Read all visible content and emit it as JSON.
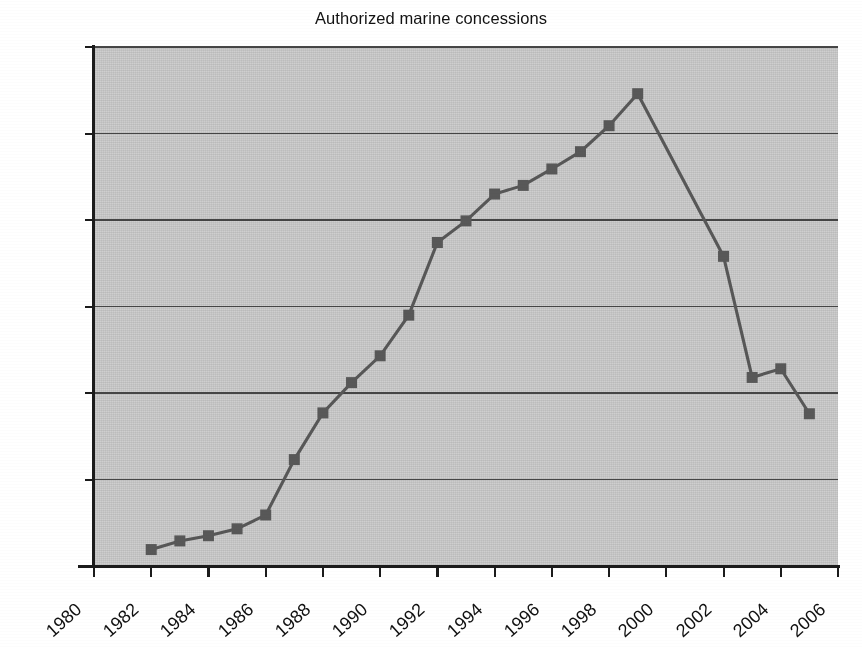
{
  "chart_data": {
    "type": "line",
    "title": "Authorized marine concessions",
    "xlabel": "",
    "ylabel": "",
    "xlim": [
      1980,
      2006
    ],
    "ylim": [
      0,
      3000
    ],
    "ytick_step": 500,
    "xtick_step": 2,
    "grid": true,
    "legend": "none",
    "marker": "square",
    "series_color": "#585858",
    "plot_background": "#c9c9c9",
    "ytick_labels": [
      "3,000",
      "2,500",
      "2,000",
      "1,500",
      "1,000",
      "500",
      "0"
    ],
    "ytick_values": [
      3000,
      2500,
      2000,
      1500,
      1000,
      500,
      0
    ],
    "xtick_labels": [
      "1980",
      "1982",
      "1984",
      "1986",
      "1988",
      "1990",
      "1992",
      "1994",
      "1996",
      "1998",
      "2000",
      "2002",
      "2004",
      "2006"
    ],
    "xtick_values": [
      1980,
      1982,
      1984,
      1986,
      1988,
      1990,
      1992,
      1994,
      1996,
      1998,
      2000,
      2002,
      2004,
      2006
    ],
    "x": [
      1982,
      1983,
      1984,
      1985,
      1986,
      1987,
      1988,
      1989,
      1990,
      1991,
      1992,
      1993,
      1994,
      1995,
      1996,
      1997,
      1998,
      1999,
      2002,
      2003,
      2004,
      2005
    ],
    "values": [
      95,
      145,
      175,
      215,
      295,
      615,
      885,
      1060,
      1215,
      1450,
      1870,
      1995,
      2150,
      2200,
      2295,
      2395,
      2545,
      2730,
      1790,
      1090,
      1140,
      880
    ],
    "series": [
      {
        "name": "Authorized marine concessions",
        "x": [
          1982,
          1983,
          1984,
          1985,
          1986,
          1987,
          1988,
          1989,
          1990,
          1991,
          1992,
          1993,
          1994,
          1995,
          1996,
          1997,
          1998,
          1999,
          2002,
          2003,
          2004,
          2005
        ],
        "values": [
          95,
          145,
          175,
          215,
          295,
          615,
          885,
          1060,
          1215,
          1450,
          1870,
          1995,
          2150,
          2200,
          2295,
          2395,
          2545,
          2730,
          1790,
          1090,
          1140,
          880
        ]
      }
    ],
    "annotations": [
      {
        "text": "peak",
        "x": 1999,
        "y": 2730
      },
      {
        "text": "gap in data between 1999 and 2002",
        "x": 2000,
        "y": null
      }
    ]
  }
}
